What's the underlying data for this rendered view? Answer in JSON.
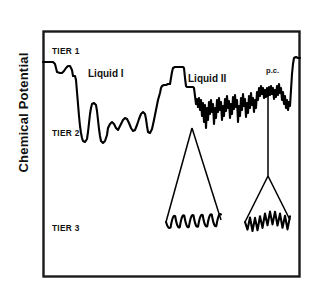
{
  "figure": {
    "axis": {
      "ylabel": "Chemical Potential",
      "xlabel": ""
    },
    "tier_labels": [
      {
        "id": "tier-1",
        "text": "TIER 1",
        "x": 52,
        "y": 54
      },
      {
        "id": "tier-2",
        "text": "TIER 2",
        "x": 52,
        "y": 136
      },
      {
        "id": "tier-3",
        "text": "TIER 3",
        "x": 52,
        "y": 231
      }
    ],
    "region_labels": [
      {
        "id": "liquid-1",
        "text": "Liquid I",
        "x": 88,
        "y": 77
      },
      {
        "id": "liquid-2",
        "text": "Liquid II",
        "x": 188,
        "y": 82
      },
      {
        "id": "p-c",
        "text": "p.c.",
        "x": 266,
        "y": 73
      }
    ],
    "frame": {
      "x": 43,
      "y": 31,
      "width": 257,
      "height": 246
    },
    "colors": {
      "trace": "#000000",
      "frame": "#1a1a1a",
      "background": "#ffffff",
      "text": "#111111"
    }
  },
  "chart_data": {
    "type": "line",
    "title": "",
    "subtitle": "",
    "xlabel": "",
    "ylabel": "Chemical Potential",
    "grid": false,
    "legend": null,
    "axis_ranges": {
      "x": [
        43,
        300
      ],
      "y_pixels": [
        31,
        277
      ]
    },
    "tier_levels": [
      {
        "name": "TIER 1",
        "y": 52
      },
      {
        "name": "TIER 2",
        "y": 132
      },
      {
        "name": "TIER 3",
        "y": 228
      }
    ],
    "annotations": [
      {
        "text": "TIER 1",
        "x": 52,
        "y": 54
      },
      {
        "text": "TIER 2",
        "x": 52,
        "y": 136
      },
      {
        "text": "TIER 3",
        "x": 52,
        "y": 231
      },
      {
        "text": "Liquid I",
        "x": 88,
        "y": 77
      },
      {
        "text": "Liquid II",
        "x": 188,
        "y": 82
      },
      {
        "text": "p.c.",
        "x": 266,
        "y": 73
      }
    ],
    "series": [
      {
        "name": "energy-landscape-trace",
        "description": "Rugged chemical potential landscape: smooth low-frequency oscillations in the Liquid I region, high-frequency jagged oscillations in the Liquid II and p.c. regions.",
        "points": [
          [
            43,
            62
          ],
          [
            49,
            62
          ],
          [
            53,
            62
          ],
          [
            55,
            64
          ],
          [
            57,
            72
          ],
          [
            60,
            73
          ],
          [
            62,
            73
          ],
          [
            64,
            71
          ],
          [
            66,
            68
          ],
          [
            68,
            66
          ],
          [
            70,
            66
          ],
          [
            72,
            70
          ],
          [
            73,
            76
          ],
          [
            74,
            76
          ],
          [
            75,
            76
          ],
          [
            76,
            80
          ],
          [
            77,
            92
          ],
          [
            78,
            104
          ],
          [
            79,
            116
          ],
          [
            80,
            126
          ],
          [
            81,
            133
          ],
          [
            82,
            138
          ],
          [
            83,
            141
          ],
          [
            85,
            142
          ],
          [
            87,
            139
          ],
          [
            88,
            132
          ],
          [
            89,
            123
          ],
          [
            90,
            114
          ],
          [
            91,
            108
          ],
          [
            92,
            104
          ],
          [
            94,
            103
          ],
          [
            96,
            105
          ],
          [
            97,
            111
          ],
          [
            98,
            120
          ],
          [
            99,
            129
          ],
          [
            100,
            136
          ],
          [
            101,
            141
          ],
          [
            103,
            143
          ],
          [
            105,
            141
          ],
          [
            107,
            135
          ],
          [
            108,
            128
          ],
          [
            110,
            124
          ],
          [
            112,
            122
          ],
          [
            114,
            124
          ],
          [
            116,
            128
          ],
          [
            118,
            130
          ],
          [
            119,
            128
          ],
          [
            121,
            124
          ],
          [
            123,
            120
          ],
          [
            125,
            118
          ],
          [
            127,
            119
          ],
          [
            129,
            123
          ],
          [
            131,
            128
          ],
          [
            133,
            131
          ],
          [
            135,
            130
          ],
          [
            137,
            125
          ],
          [
            139,
            119
          ],
          [
            141,
            114
          ],
          [
            143,
            112
          ],
          [
            145,
            114
          ],
          [
            146,
            119
          ],
          [
            147,
            126
          ],
          [
            148,
            132
          ],
          [
            150,
            133
          ],
          [
            152,
            129
          ],
          [
            154,
            120
          ],
          [
            156,
            110
          ],
          [
            158,
            100
          ],
          [
            160,
            93
          ],
          [
            161,
            88
          ],
          [
            162,
            86
          ],
          [
            164,
            85
          ],
          [
            166,
            85
          ],
          [
            168,
            84
          ],
          [
            170,
            84
          ],
          [
            172,
            72
          ],
          [
            173,
            68
          ],
          [
            175,
            67
          ],
          [
            177,
            67
          ],
          [
            179,
            67
          ],
          [
            181,
            67
          ],
          [
            183,
            67
          ],
          [
            184,
            68
          ],
          [
            185,
            78
          ],
          [
            186,
            86
          ],
          [
            187,
            87
          ],
          [
            189,
            87
          ],
          [
            191,
            87
          ],
          [
            193,
            87
          ],
          [
            194,
            88
          ],
          [
            195,
            96
          ],
          [
            196,
            104
          ],
          [
            197,
            99
          ],
          [
            198,
            107
          ],
          [
            199,
            98
          ],
          [
            200,
            110
          ],
          [
            201,
            100
          ],
          [
            202,
            116
          ],
          [
            203,
            103
          ],
          [
            204,
            122
          ],
          [
            205,
            105
          ],
          [
            206,
            128
          ],
          [
            207,
            108
          ],
          [
            208,
            120
          ],
          [
            209,
            102
          ],
          [
            210,
            114
          ],
          [
            211,
            100
          ],
          [
            212,
            112
          ],
          [
            213,
            104
          ],
          [
            214,
            124
          ],
          [
            215,
            108
          ],
          [
            216,
            118
          ],
          [
            217,
            100
          ],
          [
            218,
            112
          ],
          [
            219,
            98
          ],
          [
            220,
            110
          ],
          [
            221,
            102
          ],
          [
            222,
            120
          ],
          [
            223,
            106
          ],
          [
            224,
            116
          ],
          [
            225,
            99
          ],
          [
            226,
            111
          ],
          [
            227,
            96
          ],
          [
            228,
            108
          ],
          [
            229,
            101
          ],
          [
            230,
            118
          ],
          [
            231,
            104
          ],
          [
            232,
            114
          ],
          [
            233,
            97
          ],
          [
            234,
            109
          ],
          [
            235,
            95
          ],
          [
            236,
            107
          ],
          [
            237,
            100
          ],
          [
            238,
            122
          ],
          [
            239,
            106
          ],
          [
            240,
            116
          ],
          [
            241,
            98
          ],
          [
            242,
            110
          ],
          [
            243,
            94
          ],
          [
            244,
            106
          ],
          [
            245,
            99
          ],
          [
            246,
            117
          ],
          [
            247,
            103
          ],
          [
            248,
            113
          ],
          [
            249,
            96
          ],
          [
            250,
            108
          ],
          [
            251,
            93
          ],
          [
            252,
            105
          ],
          [
            253,
            98
          ],
          [
            254,
            112
          ],
          [
            255,
            100
          ],
          [
            256,
            108
          ],
          [
            257,
            92
          ],
          [
            258,
            100
          ],
          [
            259,
            88
          ],
          [
            260,
            96
          ],
          [
            261,
            86
          ],
          [
            262,
            94
          ],
          [
            263,
            88
          ],
          [
            264,
            98
          ],
          [
            265,
            90
          ],
          [
            266,
            97
          ],
          [
            267,
            88
          ],
          [
            268,
            96
          ],
          [
            269,
            87
          ],
          [
            270,
            95
          ],
          [
            271,
            86
          ],
          [
            272,
            94
          ],
          [
            273,
            88
          ],
          [
            274,
            99
          ],
          [
            275,
            90
          ],
          [
            276,
            97
          ],
          [
            277,
            86
          ],
          [
            278,
            95
          ],
          [
            279,
            84
          ],
          [
            280,
            93
          ],
          [
            281,
            88
          ],
          [
            282,
            100
          ],
          [
            283,
            92
          ],
          [
            284,
            104
          ],
          [
            285,
            96
          ],
          [
            286,
            108
          ],
          [
            287,
            100
          ],
          [
            288,
            110
          ],
          [
            289,
            102
          ],
          [
            290,
            106
          ],
          [
            291,
            90
          ],
          [
            292,
            74
          ],
          [
            293,
            64
          ],
          [
            294,
            58
          ],
          [
            296,
            57
          ],
          [
            298,
            58
          ],
          [
            300,
            58
          ]
        ]
      }
    ],
    "funnels": [
      {
        "name": "funnel-liquid-2",
        "apex": [
          192,
          128
        ],
        "left_base": [
          166,
          222
        ],
        "right_base": [
          221,
          220
        ],
        "basin_label": "TIER 3",
        "basin_roughness": "moderate",
        "basin_bumps": 6
      },
      {
        "name": "funnel-p-c",
        "apex": [
          268,
          88
        ],
        "stem_bottom": [
          268,
          176
        ],
        "left_base": [
          245,
          222
        ],
        "right_base": [
          290,
          220
        ],
        "basin_label": "TIER 3",
        "basin_roughness": "high",
        "basin_bumps": 9
      }
    ]
  }
}
